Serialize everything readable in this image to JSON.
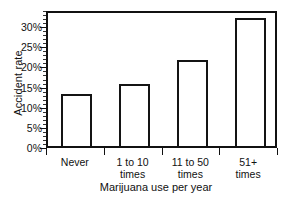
{
  "chart_data": {
    "type": "bar",
    "title": "",
    "categories": [
      "Never",
      "1 to 10 times",
      "11 to 50 times",
      "51+ times"
    ],
    "values": [
      13.0,
      15.5,
      21.3,
      31.8
    ],
    "xlabel": "Marijuana use per year",
    "ylabel": "Accident rate",
    "ylim": [
      0,
      34
    ],
    "ytick_values": [
      0,
      5,
      10,
      15,
      20,
      25,
      30
    ],
    "ytick_labels": [
      "0%",
      "5%",
      "10%",
      "15%",
      "20%",
      "25%",
      "30%"
    ],
    "grid": false,
    "legend": null,
    "bar_style": "open-outline",
    "series": [
      {
        "name": "Accident rate",
        "values": [
          13.0,
          15.5,
          21.3,
          31.8
        ]
      }
    ]
  },
  "axes": {
    "y_title": "Accident rate",
    "x_title": "Marijuana use per year",
    "x_categories": [
      {
        "line1": "Never",
        "line2": ""
      },
      {
        "line1": "1 to 10",
        "line2": "times"
      },
      {
        "line1": "11 to 50",
        "line2": "times"
      },
      {
        "line1": "51+",
        "line2": "times"
      }
    ]
  },
  "colors": {
    "bar_outline": "#141414",
    "bar_fill": "#ffffff",
    "axis": "#111111",
    "background": "#ffffff",
    "text": "#111111"
  }
}
